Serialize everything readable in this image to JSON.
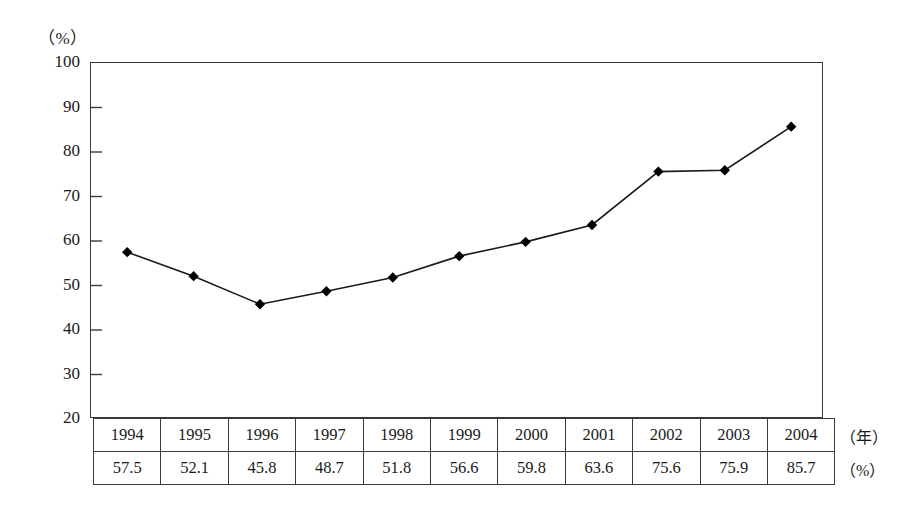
{
  "figure": {
    "y_unit_label": "（%）",
    "row_unit_year": "（年）",
    "row_unit_percent": "（%）"
  },
  "table": {
    "year_row": [
      "1994",
      "1995",
      "1996",
      "1997",
      "1998",
      "1999",
      "2000",
      "2001",
      "2002",
      "2003",
      "2004"
    ],
    "value_row": [
      "57.5",
      "52.1",
      "45.8",
      "48.7",
      "51.8",
      "56.6",
      "59.8",
      "63.6",
      "75.6",
      "75.9",
      "85.7"
    ]
  },
  "y_ticks": [
    "100",
    "90",
    "80",
    "70",
    "60",
    "50",
    "40",
    "30",
    "20"
  ],
  "colors": {
    "line": "#1a1a1a",
    "marker": "#000000",
    "axis": "#3a3a3a",
    "background": "#ffffff"
  },
  "chart_data": {
    "type": "line",
    "title": "",
    "subtitle": "",
    "xlabel": "（年）",
    "ylabel": "（%）",
    "x": [
      1994,
      1995,
      1996,
      1997,
      1998,
      1999,
      2000,
      2001,
      2002,
      2003,
      2004
    ],
    "categories": [
      "1994",
      "1995",
      "1996",
      "1997",
      "1998",
      "1999",
      "2000",
      "2001",
      "2002",
      "2003",
      "2004"
    ],
    "values": [
      57.5,
      52.1,
      45.8,
      48.7,
      51.8,
      56.6,
      59.8,
      63.6,
      75.6,
      75.9,
      85.7
    ],
    "series": [
      {
        "name": "",
        "values": [
          57.5,
          52.1,
          45.8,
          48.7,
          51.8,
          56.6,
          59.8,
          63.6,
          75.6,
          75.9,
          85.7
        ]
      }
    ],
    "ylim": [
      20,
      100
    ],
    "ytick_step": 10,
    "yticks": [
      20,
      30,
      40,
      50,
      60,
      70,
      80,
      90,
      100
    ],
    "grid": false,
    "legend": false,
    "marker": "diamond",
    "data_labels_in_table": true
  }
}
